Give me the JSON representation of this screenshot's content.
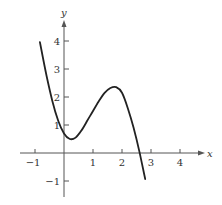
{
  "chart_data": {
    "type": "line",
    "title": "",
    "xlabel": "x",
    "ylabel": "y",
    "xlim": [
      -1.5,
      4.7
    ],
    "ylim": [
      -1.6,
      4.8
    ],
    "grid": false,
    "x_ticks": [
      -1,
      1,
      2,
      3,
      4
    ],
    "x_tick_labels": [
      "−1",
      "1",
      "2",
      "3",
      "4"
    ],
    "y_ticks": [
      -1,
      1,
      2,
      3,
      4
    ],
    "y_tick_labels": [
      "−1",
      "1",
      "2",
      "3",
      "4"
    ],
    "series": [
      {
        "name": "f(x)",
        "x": [
          -0.83,
          -0.6,
          -0.4,
          -0.2,
          0.0,
          0.2,
          0.4,
          0.6,
          0.8,
          1.0,
          1.2,
          1.4,
          1.6,
          1.8,
          2.0,
          2.2,
          2.4,
          2.6,
          2.8
        ],
        "y": [
          3.96,
          2.75,
          1.85,
          1.15,
          0.7,
          0.5,
          0.55,
          0.8,
          1.15,
          1.5,
          1.85,
          2.15,
          2.32,
          2.35,
          2.15,
          1.6,
          0.9,
          0.05,
          -0.93
        ]
      }
    ],
    "features": {
      "local_min": [
        0.2,
        0.5
      ],
      "local_max": [
        1.8,
        2.35
      ],
      "x_intercept": 2.65
    }
  },
  "colors": {
    "axis": "#555555",
    "curve": "#222222",
    "text": "#333333"
  }
}
